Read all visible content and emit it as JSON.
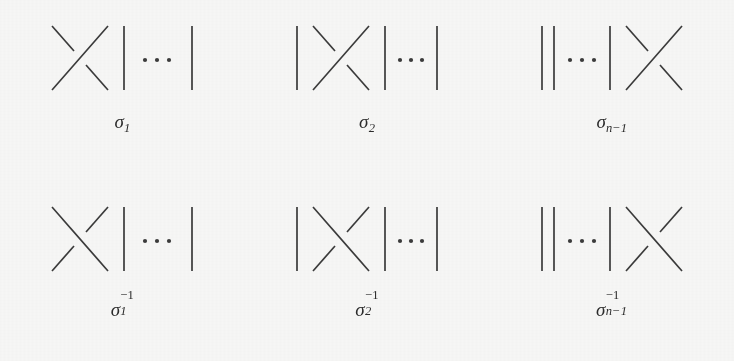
{
  "figure": {
    "background_color": "#f7f7f6",
    "stroke_color": "#3a3a3a",
    "ellipsis": "⋯"
  },
  "generators": [
    {
      "id": "sigma-1",
      "sigma": "σ",
      "subscript": "1",
      "superscript": "",
      "crossing_sign": "positive",
      "over_strand": "sw-ne",
      "strand_layout": [
        "crossing",
        "line",
        "dots",
        "line"
      ]
    },
    {
      "id": "sigma-2",
      "sigma": "σ",
      "subscript": "2",
      "superscript": "",
      "crossing_sign": "positive",
      "over_strand": "sw-ne",
      "strand_layout": [
        "line",
        "crossing",
        "line",
        "dots",
        "line"
      ]
    },
    {
      "id": "sigma-n-minus-1",
      "sigma": "σ",
      "subscript": "n−1",
      "superscript": "",
      "crossing_sign": "positive",
      "over_strand": "sw-ne",
      "strand_layout": [
        "line",
        "line",
        "dots",
        "line",
        "crossing"
      ]
    },
    {
      "id": "sigma-1-inverse",
      "sigma": "σ",
      "subscript": "1",
      "superscript": "−1",
      "crossing_sign": "negative",
      "over_strand": "nw-se",
      "strand_layout": [
        "crossing",
        "line",
        "dots",
        "line"
      ]
    },
    {
      "id": "sigma-2-inverse",
      "sigma": "σ",
      "subscript": "2",
      "superscript": "−1",
      "crossing_sign": "negative",
      "over_strand": "nw-se",
      "strand_layout": [
        "line",
        "crossing",
        "line",
        "dots",
        "line"
      ]
    },
    {
      "id": "sigma-n-minus-1-inverse",
      "sigma": "σ",
      "subscript": "n−1",
      "superscript": "−1",
      "crossing_sign": "negative",
      "over_strand": "nw-se",
      "strand_layout": [
        "line",
        "line",
        "dots",
        "line",
        "crossing"
      ]
    }
  ]
}
